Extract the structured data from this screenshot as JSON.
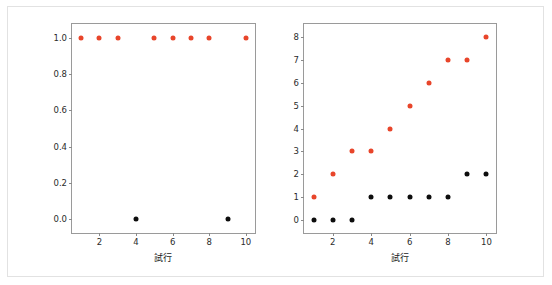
{
  "figure": {
    "width": 552,
    "height": 285,
    "background": "#ffffff",
    "frame_color": "#e2e2e2",
    "axes_edge_color": "#9a9a9a",
    "series_colors": {
      "orange": "#e8452a",
      "black": "#0d0d0d"
    }
  },
  "chart_data": [
    {
      "type": "scatter",
      "panel": "left",
      "title": "",
      "xlabel": "試行",
      "ylabel": "",
      "xlim": [
        0.5,
        10.5
      ],
      "ylim": [
        -0.08,
        1.08
      ],
      "xticks": [
        2,
        4,
        6,
        8,
        10
      ],
      "xticklabels": [
        "2",
        "4",
        "6",
        "8",
        "10"
      ],
      "yticks": [
        0.0,
        0.2,
        0.4,
        0.6,
        0.8,
        1.0
      ],
      "yticklabels": [
        "0.0",
        "0.2",
        "0.4",
        "0.6",
        "0.8",
        "1.0"
      ],
      "grid": false,
      "legend": "none",
      "series": [
        {
          "name": "orange",
          "color": "#e8452a",
          "x": [
            1,
            2,
            3,
            5,
            6,
            7,
            8,
            10
          ],
          "y": [
            1.0,
            1.0,
            1.0,
            1.0,
            1.0,
            1.0,
            1.0,
            1.0
          ]
        },
        {
          "name": "black",
          "color": "#0d0d0d",
          "x": [
            4,
            9
          ],
          "y": [
            0.0,
            0.0
          ]
        }
      ]
    },
    {
      "type": "scatter",
      "panel": "right",
      "title": "",
      "xlabel": "試行",
      "ylabel": "",
      "xlim": [
        0.5,
        10.5
      ],
      "ylim": [
        -0.55,
        8.55
      ],
      "xticks": [
        2,
        4,
        6,
        8,
        10
      ],
      "xticklabels": [
        "2",
        "4",
        "6",
        "8",
        "10"
      ],
      "yticks": [
        0,
        1,
        2,
        3,
        4,
        5,
        6,
        7,
        8
      ],
      "yticklabels": [
        "0",
        "1",
        "2",
        "3",
        "4",
        "5",
        "6",
        "7",
        "8"
      ],
      "grid": false,
      "legend": "none",
      "series": [
        {
          "name": "orange",
          "color": "#e8452a",
          "x": [
            1,
            2,
            3,
            4,
            5,
            6,
            7,
            8,
            9,
            10
          ],
          "y": [
            1,
            2,
            3,
            3,
            4,
            5,
            6,
            7,
            7,
            8
          ]
        },
        {
          "name": "black",
          "color": "#0d0d0d",
          "x": [
            1,
            2,
            3,
            4,
            5,
            6,
            7,
            8,
            9,
            10
          ],
          "y": [
            0,
            0,
            0,
            1,
            1,
            1,
            1,
            1,
            2,
            2
          ]
        }
      ]
    }
  ]
}
